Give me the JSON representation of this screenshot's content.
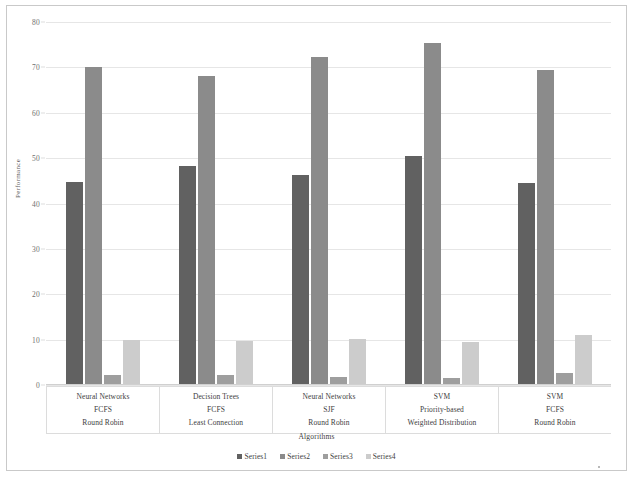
{
  "chart_data": {
    "type": "bar",
    "title": "",
    "xlabel": "Algorithms",
    "ylabel": "Performance",
    "ylim": [
      0,
      80
    ],
    "yticks": [
      0,
      10,
      20,
      30,
      40,
      50,
      60,
      70,
      80
    ],
    "grid": true,
    "legend_position": "bottom",
    "categories": [
      "Neural Networks | FCFS | Round Robin",
      "Decision Trees | FCFS | Least Connection",
      "Neural Networks | SJF | Round Robin",
      "SVM | Priority-based | Weighted Distribution",
      "SVM | FCFS | Round Robin"
    ],
    "category_lines": [
      [
        "Neural Networks",
        "FCFS",
        "Round Robin"
      ],
      [
        "Decision Trees",
        "FCFS",
        "Least Connection"
      ],
      [
        "Neural Networks",
        "SJF",
        "Round Robin"
      ],
      [
        "SVM",
        "Priority-based",
        "Weighted Distribution"
      ],
      [
        "SVM",
        "FCFS",
        "Round Robin"
      ]
    ],
    "series": [
      {
        "name": "Series1",
        "color": "#616161",
        "values": [
          44.8,
          48.2,
          46.2,
          50.4,
          44.5
        ]
      },
      {
        "name": "Series2",
        "color": "#8b8b8b",
        "values": [
          70.0,
          68.1,
          72.2,
          75.4,
          69.5
        ]
      },
      {
        "name": "Series3",
        "color": "#9e9e9e",
        "values": [
          2.1,
          2.2,
          1.7,
          1.6,
          2.7
        ]
      },
      {
        "name": "Series4",
        "color": "#cccccc",
        "values": [
          10.0,
          9.6,
          10.1,
          9.5,
          11.0
        ]
      }
    ]
  },
  "legend": {
    "items": [
      {
        "label": "Series1",
        "color": "#616161"
      },
      {
        "label": "Series2",
        "color": "#8b8b8b"
      },
      {
        "label": "Series3",
        "color": "#9e9e9e"
      },
      {
        "label": "Series4",
        "color": "#cccccc"
      }
    ]
  }
}
